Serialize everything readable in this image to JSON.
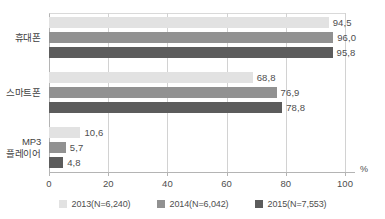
{
  "chart_data": {
    "type": "bar",
    "orientation": "horizontal",
    "title": "",
    "xlabel": "%",
    "ylabel": "",
    "xlim": [
      0,
      100
    ],
    "xticks": [
      "0",
      "20",
      "40",
      "60",
      "80",
      "100"
    ],
    "xtick_values": [
      0,
      20,
      40,
      60,
      80,
      100
    ],
    "grid": true,
    "legend_position": "bottom",
    "categories": [
      "휴대폰",
      "스마트폰",
      "MP3\n플레이어"
    ],
    "series": [
      {
        "name": "2013(N=6,240)",
        "color": "#e2e2e2",
        "values": [
          94.5,
          68.8,
          10.6
        ],
        "labels": [
          "94,5",
          "68,8",
          "10,6"
        ]
      },
      {
        "name": "2014(N=6,042)",
        "color": "#919191",
        "values": [
          96.0,
          76.9,
          5.7
        ],
        "labels": [
          "96,0",
          "76,9",
          "5,7"
        ]
      },
      {
        "name": "2015(N=7,553)",
        "color": "#5c5c5c",
        "values": [
          95.8,
          78.8,
          4.8
        ],
        "labels": [
          "95,8",
          "78,8",
          "4,8"
        ]
      }
    ]
  },
  "axis": {
    "unit_label": "%",
    "ticks": [
      "0",
      "20",
      "40",
      "60",
      "80",
      "100"
    ]
  },
  "categories": [
    {
      "label": "휴대폰"
    },
    {
      "label": "스마트폰"
    },
    {
      "label": "MP3\n플레이어"
    }
  ],
  "legend": {
    "items": [
      {
        "label": "2013(N=6,240)",
        "color": "#e2e2e2"
      },
      {
        "label": "2014(N=6,042)",
        "color": "#919191"
      },
      {
        "label": "2015(N=7,553)",
        "color": "#5c5c5c"
      }
    ]
  },
  "colors": {
    "series_2013": "#e2e2e2",
    "series_2014": "#919191",
    "series_2015": "#5c5c5c",
    "grid": "#d2d2d2",
    "axis": "#b4b4b4",
    "text": "#4e4e4e"
  }
}
